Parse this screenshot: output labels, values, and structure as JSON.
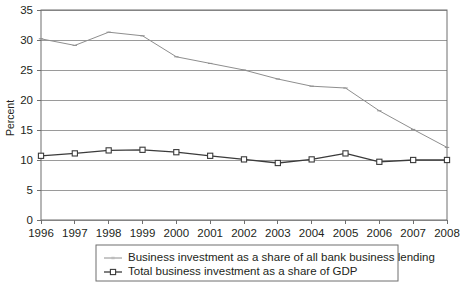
{
  "chart_data": {
    "type": "line",
    "title": "",
    "xlabel": "",
    "ylabel": "Percent",
    "categories": [
      "1996",
      "1997",
      "1998",
      "1999",
      "2000",
      "2001",
      "2002",
      "2003",
      "2004",
      "2005",
      "2006",
      "2007",
      "2008"
    ],
    "x": [
      1996,
      1997,
      1998,
      1999,
      2000,
      2001,
      2002,
      2003,
      2004,
      2005,
      2006,
      2007,
      2008
    ],
    "xlim": [
      1996,
      2008
    ],
    "ylim": [
      0,
      35
    ],
    "y_ticks": [
      0,
      5,
      10,
      15,
      20,
      25,
      30,
      35
    ],
    "y_tick_labels": [
      "0",
      "5",
      "10",
      "15",
      "20",
      "25",
      "30",
      "35"
    ],
    "grid": "horizontal",
    "legend_position": "bottom",
    "series": [
      {
        "name": "Business investment as a share of all bank business lending",
        "color": "#8e8e8e",
        "marker": "none",
        "values": [
          30.2,
          29.1,
          31.3,
          30.7,
          27.2,
          26.1,
          25.0,
          23.5,
          22.3,
          22.0,
          18.2,
          15.1,
          12.1
        ]
      },
      {
        "name": "Total business investment as a share of GDP",
        "color": "#3b3b3b",
        "marker": "open-square",
        "values": [
          10.7,
          11.1,
          11.6,
          11.7,
          11.3,
          10.7,
          10.1,
          9.5,
          10.1,
          11.1,
          9.7,
          10.0,
          10.0
        ]
      }
    ]
  },
  "legend": {
    "items": [
      {
        "label": "Business investment as a share of all bank business lending",
        "marker": "line-plain"
      },
      {
        "label": "Total business investment as a share of GDP",
        "marker": "line-open-square"
      }
    ]
  },
  "colors": {
    "series1": "#8e8e8e",
    "series2": "#3b3b3b",
    "grid": "#9a9a9a",
    "axis": "#6f6f6f",
    "text": "#231f20",
    "background": "#ffffff",
    "legend_border": "#6f6f6f"
  }
}
